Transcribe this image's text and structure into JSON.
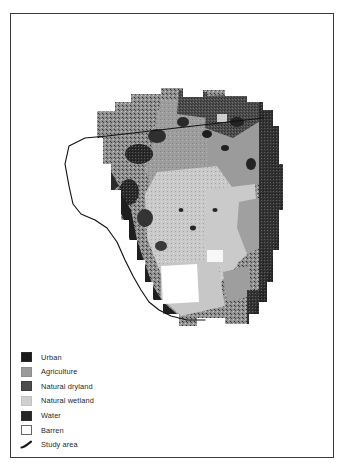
{
  "figure": {
    "type": "thematic-land-cover-map",
    "background_color": "#ffffff",
    "frame_color": "#3a3a3a"
  },
  "map": {
    "name": "land-cover-raster-map",
    "description": "Grayscale classified land cover raster of a peninsular region with study-area boundary overlay",
    "base_color": "#ffffff",
    "classes": [
      {
        "key": "urban",
        "label": "Urban",
        "color": "#1a1a1a"
      },
      {
        "key": "agriculture",
        "label": "Agriculture",
        "color": "#9a9a9a"
      },
      {
        "key": "natural_dryland",
        "label": "Natural dryland",
        "color": "#4e4e4e"
      },
      {
        "key": "natural_wetland",
        "label": "Natural wetland",
        "color": "#cfcfcf"
      },
      {
        "key": "water",
        "label": "Water",
        "color": "#262626"
      },
      {
        "key": "barren",
        "label": "Barren",
        "color": "#ffffff"
      }
    ],
    "study_area": {
      "label": "Study area",
      "line_color": "#111111",
      "line_width": 1.1
    }
  },
  "legend": {
    "name": "map-legend",
    "items": [
      {
        "label": "Urban",
        "swatch": "urban-swatch",
        "color": "#1a1a1a",
        "style": "fill"
      },
      {
        "label": "Agriculture",
        "swatch": "agriculture-swatch",
        "color": "#9a9a9a",
        "style": "fill"
      },
      {
        "label": "Natural dryland",
        "swatch": "natural-dryland-swatch",
        "color": "#4e4e4e",
        "style": "fill"
      },
      {
        "label": "Natural wetland",
        "swatch": "natural-wetland-swatch",
        "color": "#cfcfcf",
        "style": "fill"
      },
      {
        "label": "Water",
        "swatch": "water-swatch",
        "color": "#262626",
        "style": "fill"
      },
      {
        "label": "Barren",
        "swatch": "barren-swatch",
        "color": "#ffffff",
        "style": "outline"
      },
      {
        "label": "Study area",
        "swatch": "study-area-line-swatch",
        "color": "#1a1a1a",
        "style": "line"
      }
    ]
  }
}
